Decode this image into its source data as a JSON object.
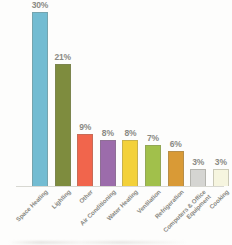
{
  "chart_data": {
    "type": "bar",
    "title": "",
    "subtitle": "",
    "xlabel": "",
    "ylabel": "",
    "grid": false,
    "legend": "none",
    "ylim": [
      0,
      32
    ],
    "value_suffix": "%",
    "categories": [
      "Space Heating",
      "Lighting",
      "Other",
      "Air Conditioning",
      "Water Heating",
      "Ventilation",
      "Refrigeration",
      "Computers & Office Equipment",
      "Cooking"
    ],
    "category_lines": [
      [
        "Space Heating"
      ],
      [
        "Lighting"
      ],
      [
        "Other"
      ],
      [
        "Air Conditioning"
      ],
      [
        "Water Heating"
      ],
      [
        "Ventilation"
      ],
      [
        "Refrigeration"
      ],
      [
        "Computers & Office",
        "Equipment"
      ],
      [
        "Cooking"
      ]
    ],
    "values": [
      30,
      21,
      9,
      8,
      8,
      7,
      6,
      3,
      3
    ],
    "value_labels": [
      "30%",
      "21%",
      "9%",
      "8%",
      "8%",
      "7%",
      "6%",
      "3%",
      "3%"
    ],
    "colors": [
      "#73bcd2",
      "#7e8c3e",
      "#f1654c",
      "#9c6cab",
      "#f3d139",
      "#a1c04b",
      "#d99a36",
      "#d5d5d2",
      "#f6f5df"
    ],
    "label_color": "#8a8a84",
    "axis_color": "#d8d8d2",
    "background": "#fdfdfc"
  }
}
